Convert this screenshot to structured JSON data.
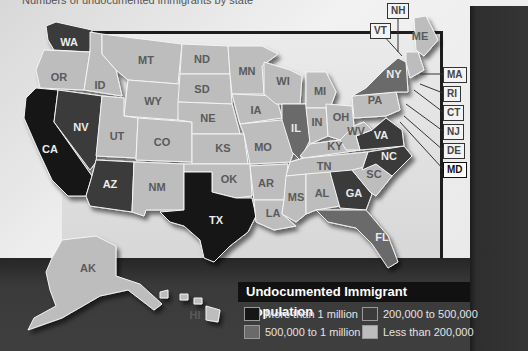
{
  "caption": "Numbers of undocumented immigrants by state",
  "colors": {
    "more_than_1m": "#161616",
    "from_500k_to_1m": "#6a6a6a",
    "from_200k_to_500k": "#3b3b3b",
    "less_than_200k": "#bdbdbd",
    "label_dark_text": "#ececec",
    "label_light_text": "#5a5a5a"
  },
  "legend": {
    "title": "Undocumented Immigrant Population",
    "items": [
      {
        "key": "more_than_1m",
        "label": "More than 1 million"
      },
      {
        "key": "from_200k_to_500k",
        "label": "200,000 to 500,000"
      },
      {
        "key": "from_500k_to_1m",
        "label": "500,000 to 1 million"
      },
      {
        "key": "less_than_200k",
        "label": "Less than 200,000"
      }
    ]
  },
  "states": {
    "WA": "from_200k_to_500k",
    "OR": "less_than_200k",
    "CA": "more_than_1m",
    "NV": "from_200k_to_500k",
    "ID": "less_than_200k",
    "MT": "less_than_200k",
    "WY": "less_than_200k",
    "UT": "less_than_200k",
    "AZ": "from_200k_to_500k",
    "CO": "less_than_200k",
    "NM": "less_than_200k",
    "ND": "less_than_200k",
    "SD": "less_than_200k",
    "NE": "less_than_200k",
    "KS": "less_than_200k",
    "OK": "less_than_200k",
    "TX": "more_than_1m",
    "MN": "less_than_200k",
    "IA": "less_than_200k",
    "MO": "less_than_200k",
    "AR": "less_than_200k",
    "LA": "less_than_200k",
    "WI": "less_than_200k",
    "IL": "from_500k_to_1m",
    "MI": "less_than_200k",
    "IN": "less_than_200k",
    "OH": "less_than_200k",
    "KY": "less_than_200k",
    "TN": "less_than_200k",
    "MS": "less_than_200k",
    "AL": "less_than_200k",
    "GA": "from_200k_to_500k",
    "FL": "from_500k_to_1m",
    "SC": "less_than_200k",
    "NC": "from_200k_to_500k",
    "VA": "from_200k_to_500k",
    "WV": "less_than_200k",
    "PA": "less_than_200k",
    "NY": "from_500k_to_1m",
    "ME": "less_than_200k",
    "AK": "less_than_200k",
    "HI": "less_than_200k"
  },
  "state_labels": [
    {
      "abbr": "WA",
      "x": 69,
      "y": 43,
      "dark": true
    },
    {
      "abbr": "OR",
      "x": 59,
      "y": 78,
      "dark": false
    },
    {
      "abbr": "CA",
      "x": 50,
      "y": 150,
      "dark": true
    },
    {
      "abbr": "NV",
      "x": 81,
      "y": 128,
      "dark": true
    },
    {
      "abbr": "ID",
      "x": 100,
      "y": 86,
      "dark": false
    },
    {
      "abbr": "MT",
      "x": 146,
      "y": 61,
      "dark": false
    },
    {
      "abbr": "WY",
      "x": 153,
      "y": 102,
      "dark": false
    },
    {
      "abbr": "UT",
      "x": 117,
      "y": 137,
      "dark": false
    },
    {
      "abbr": "AZ",
      "x": 110,
      "y": 185,
      "dark": true
    },
    {
      "abbr": "CO",
      "x": 162,
      "y": 143,
      "dark": false
    },
    {
      "abbr": "NM",
      "x": 157,
      "y": 188,
      "dark": false
    },
    {
      "abbr": "ND",
      "x": 202,
      "y": 60,
      "dark": false
    },
    {
      "abbr": "SD",
      "x": 202,
      "y": 90,
      "dark": false
    },
    {
      "abbr": "NE",
      "x": 208,
      "y": 119,
      "dark": false
    },
    {
      "abbr": "KS",
      "x": 223,
      "y": 149,
      "dark": false
    },
    {
      "abbr": "OK",
      "x": 229,
      "y": 180,
      "dark": false
    },
    {
      "abbr": "TX",
      "x": 216,
      "y": 221,
      "dark": true
    },
    {
      "abbr": "MN",
      "x": 247,
      "y": 72,
      "dark": false
    },
    {
      "abbr": "IA",
      "x": 256,
      "y": 111,
      "dark": false
    },
    {
      "abbr": "MO",
      "x": 263,
      "y": 148,
      "dark": false
    },
    {
      "abbr": "AR",
      "x": 266,
      "y": 184,
      "dark": false
    },
    {
      "abbr": "LA",
      "x": 273,
      "y": 214,
      "dark": false
    },
    {
      "abbr": "WI",
      "x": 283,
      "y": 82,
      "dark": false
    },
    {
      "abbr": "IL",
      "x": 296,
      "y": 129,
      "dark": true
    },
    {
      "abbr": "MI",
      "x": 320,
      "y": 92,
      "dark": false
    },
    {
      "abbr": "IN",
      "x": 317,
      "y": 123,
      "dark": false
    },
    {
      "abbr": "OH",
      "x": 341,
      "y": 118,
      "dark": false
    },
    {
      "abbr": "KY",
      "x": 335,
      "y": 147,
      "dark": false
    },
    {
      "abbr": "TN",
      "x": 324,
      "y": 167,
      "dark": false
    },
    {
      "abbr": "MS",
      "x": 296,
      "y": 198,
      "dark": false
    },
    {
      "abbr": "AL",
      "x": 322,
      "y": 194,
      "dark": false
    },
    {
      "abbr": "GA",
      "x": 354,
      "y": 194,
      "dark": true
    },
    {
      "abbr": "FL",
      "x": 382,
      "y": 238,
      "dark": true
    },
    {
      "abbr": "SC",
      "x": 374,
      "y": 175,
      "dark": false
    },
    {
      "abbr": "NC",
      "x": 389,
      "y": 157,
      "dark": true
    },
    {
      "abbr": "VA",
      "x": 381,
      "y": 136,
      "dark": true
    },
    {
      "abbr": "WV",
      "x": 356,
      "y": 132,
      "dark": false
    },
    {
      "abbr": "PA",
      "x": 375,
      "y": 101,
      "dark": false
    },
    {
      "abbr": "NY",
      "x": 394,
      "y": 75,
      "dark": true
    },
    {
      "abbr": "ME",
      "x": 420,
      "y": 37,
      "dark": false
    },
    {
      "abbr": "AK",
      "x": 88,
      "y": 269,
      "dark": false
    },
    {
      "abbr": "HI",
      "x": 195,
      "y": 316,
      "dark": false
    }
  ],
  "callouts": [
    {
      "abbr": "NH",
      "x": 387,
      "y": 3
    },
    {
      "abbr": "VT",
      "x": 370,
      "y": 23
    },
    {
      "abbr": "MA",
      "x": 443,
      "y": 67
    },
    {
      "abbr": "RI",
      "x": 443,
      "y": 86
    },
    {
      "abbr": "CT",
      "x": 443,
      "y": 105
    },
    {
      "abbr": "NJ",
      "x": 443,
      "y": 124
    },
    {
      "abbr": "DE",
      "x": 443,
      "y": 143
    },
    {
      "abbr": "MD",
      "x": 443,
      "y": 162
    }
  ]
}
